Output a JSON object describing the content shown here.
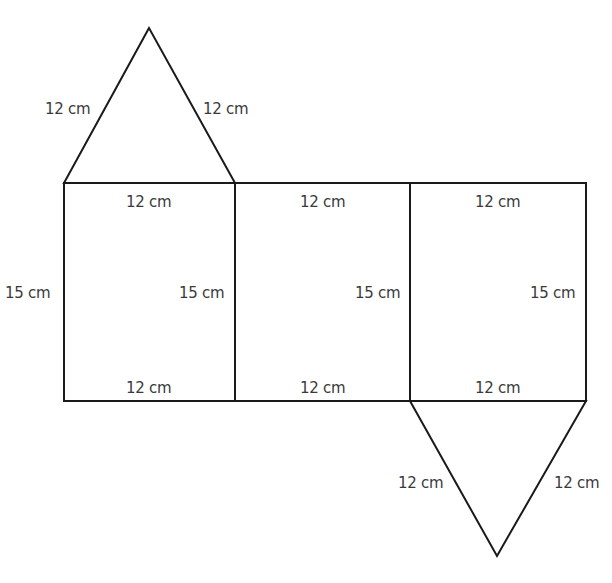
{
  "diagram": {
    "type": "net-of-triangular-prism",
    "stroke_color": "#1a1a1a",
    "label_color": "#3a3a3a",
    "top_triangle": {
      "left_side_label": "12 cm",
      "right_side_label": "12 cm"
    },
    "faces": [
      {
        "top_label": "12 cm",
        "bottom_label": "12 cm",
        "left_label": "15 cm",
        "right_label": "15 cm"
      },
      {
        "top_label": "12 cm",
        "bottom_label": "12 cm",
        "right_label": "15 cm"
      },
      {
        "top_label": "12 cm",
        "bottom_label": "12 cm",
        "right_label": "15 cm"
      }
    ],
    "bottom_triangle": {
      "left_side_label": "12 cm",
      "right_side_label": "12 cm"
    }
  }
}
